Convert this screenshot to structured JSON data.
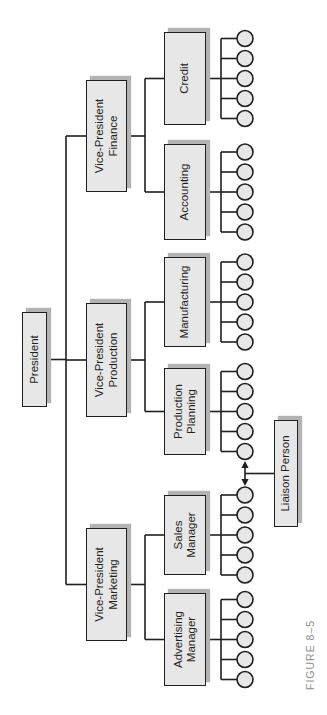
{
  "figure_caption": "FIGURE 8–5",
  "org": {
    "root": {
      "id": "president",
      "label_lines": [
        "President"
      ]
    },
    "vps": [
      {
        "id": "vp-marketing",
        "label_lines": [
          "Vice-President",
          "Marketing"
        ],
        "managers": [
          {
            "id": "advertising-manager",
            "label_lines": [
              "Advertising",
              "Manager"
            ],
            "workers": 5
          },
          {
            "id": "sales-manager",
            "label_lines": [
              "Sales",
              "Manager"
            ],
            "workers": 5
          }
        ]
      },
      {
        "id": "vp-production",
        "label_lines": [
          "Vice-President",
          "Production"
        ],
        "managers": [
          {
            "id": "production-planning",
            "label_lines": [
              "Production",
              "Planning"
            ],
            "workers": 5
          },
          {
            "id": "manufacturing",
            "label_lines": [
              "Manufacturing"
            ],
            "workers": 5
          }
        ]
      },
      {
        "id": "vp-finance",
        "label_lines": [
          "Vice-President",
          "Finance"
        ],
        "managers": [
          {
            "id": "accounting",
            "label_lines": [
              "Accounting"
            ],
            "workers": 5
          },
          {
            "id": "credit",
            "label_lines": [
              "Credit"
            ],
            "workers": 5
          }
        ]
      }
    ],
    "liaison": {
      "id": "liaison-person",
      "label_lines": [
        "Liaison Person"
      ]
    }
  },
  "colors": {
    "background": "#ffffff",
    "box_fill": "#e7e7e7",
    "box_border": "#1f1f1f",
    "shadow": "#b3b3b3",
    "connector": "#1f1f1f",
    "worker_fill": "#e7e7e7",
    "caption_text": "#8f8f8f"
  }
}
